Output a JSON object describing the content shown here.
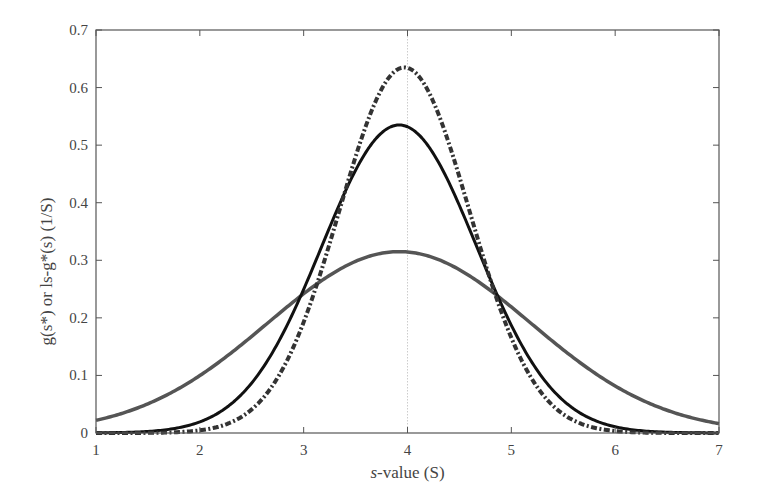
{
  "chart_data": {
    "type": "line",
    "title": "",
    "xlabel": "s-value (S)",
    "xlabel_italic_prefix": "s",
    "xlabel_rest": "-value (S)",
    "ylabel": "g(s*) or ls-g*(s) (1/S)",
    "xlim": [
      1,
      7
    ],
    "ylim": [
      0,
      0.7
    ],
    "x_ticks": [
      1,
      2,
      3,
      4,
      5,
      6,
      7
    ],
    "x_tick_labels": [
      "1",
      "2",
      "3",
      "4",
      "5",
      "6",
      "7"
    ],
    "y_ticks": [
      0,
      0.1,
      0.2,
      0.3,
      0.4,
      0.5,
      0.6,
      0.7
    ],
    "y_tick_labels": [
      "0",
      "0.1",
      "0.2",
      "0.3",
      "0.4",
      "0.5",
      "0.6",
      "0.7"
    ],
    "grid": false,
    "legend": null,
    "reference_line": {
      "orientation": "vertical",
      "x": 4.0,
      "style": "dotted",
      "color": "#cccccc"
    },
    "series": [
      {
        "name": "gray-solid",
        "style": "solid",
        "color": "#555555",
        "model": {
          "kind": "gaussian",
          "mu": 3.92,
          "sigma": 1.266,
          "peak": 0.315
        },
        "x": [
          1.0,
          1.5,
          2.0,
          2.5,
          3.0,
          3.5,
          3.92,
          4.5,
          5.0,
          5.5,
          6.0,
          6.5,
          7.0
        ],
        "values": [
          0.02,
          0.05,
          0.1,
          0.17,
          0.24,
          0.3,
          0.315,
          0.28,
          0.22,
          0.15,
          0.08,
          0.04,
          0.016
        ]
      },
      {
        "name": "black-solid",
        "style": "solid",
        "color": "#111111",
        "model": {
          "kind": "gaussian",
          "mu": 3.92,
          "sigma": 0.745,
          "peak": 0.535
        },
        "x": [
          1.0,
          1.5,
          2.0,
          2.5,
          3.0,
          3.5,
          3.92,
          4.5,
          5.0,
          5.5,
          6.0,
          6.5,
          7.0
        ],
        "values": [
          0.0,
          0.003,
          0.02,
          0.09,
          0.26,
          0.45,
          0.535,
          0.39,
          0.19,
          0.06,
          0.01,
          0.001,
          0.0
        ]
      },
      {
        "name": "black-dash-dot",
        "style": "dashdot",
        "color": "#333333",
        "model": {
          "kind": "gaussian",
          "mu": 3.97,
          "sigma": 0.628,
          "peak": 0.635
        },
        "x": [
          1.0,
          1.5,
          2.0,
          2.5,
          3.0,
          3.5,
          3.97,
          4.5,
          5.0,
          5.5,
          6.0,
          6.5,
          7.0
        ],
        "values": [
          0.0,
          0.0,
          0.005,
          0.04,
          0.2,
          0.48,
          0.635,
          0.45,
          0.17,
          0.03,
          0.003,
          0.0,
          0.0
        ]
      }
    ]
  },
  "plot": {
    "frame": {
      "left": 96,
      "right": 719,
      "top": 30,
      "bottom": 433
    }
  }
}
